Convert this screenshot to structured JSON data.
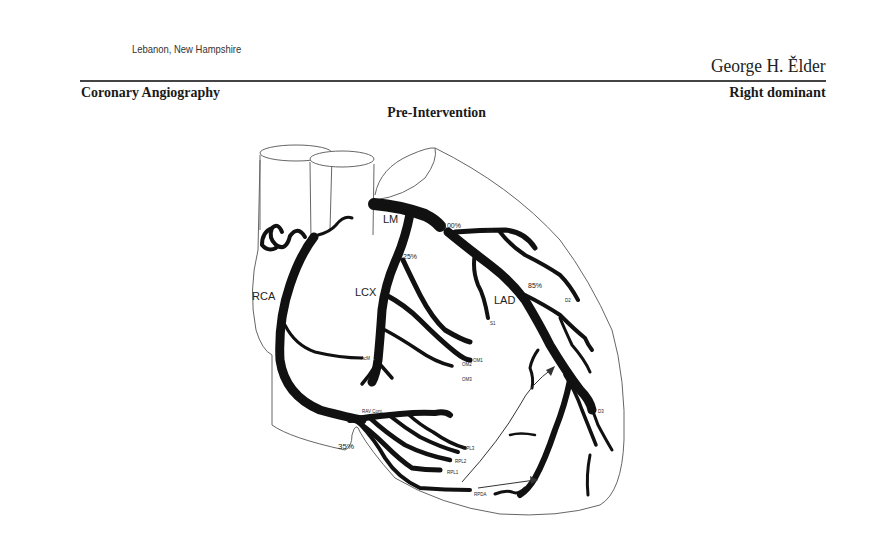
{
  "header": {
    "location": "Lebanon, New Hampshire",
    "patient_name": "George H. Ělder",
    "study_title": "Coronary Angiography",
    "dominance": "Right dominant",
    "phase": "Pre-Intervention"
  },
  "diagram": {
    "vessel_labels": {
      "rca": "RCA",
      "lm": "LM",
      "lcx": "LCX",
      "lad": "LAD"
    },
    "branch_labels": {
      "d1": "D1",
      "d2": "D2",
      "d3": "D3",
      "s1": "S1",
      "om1": "OM1",
      "om2": "OM2",
      "om3": "OM3",
      "acm": "AcM",
      "rav_cont": "RAV Cont.",
      "rpl1": "RPL1",
      "rpl2": "RPL2",
      "rpl3": "RPL3",
      "rpda": "RPDA"
    },
    "stenoses": {
      "lad_proximal": "100%",
      "lcx_proximal": "25%",
      "lad_mid": "85%",
      "rca_distal": "35%"
    },
    "colors": {
      "vessel": "#111111",
      "outline": "#666666"
    }
  }
}
